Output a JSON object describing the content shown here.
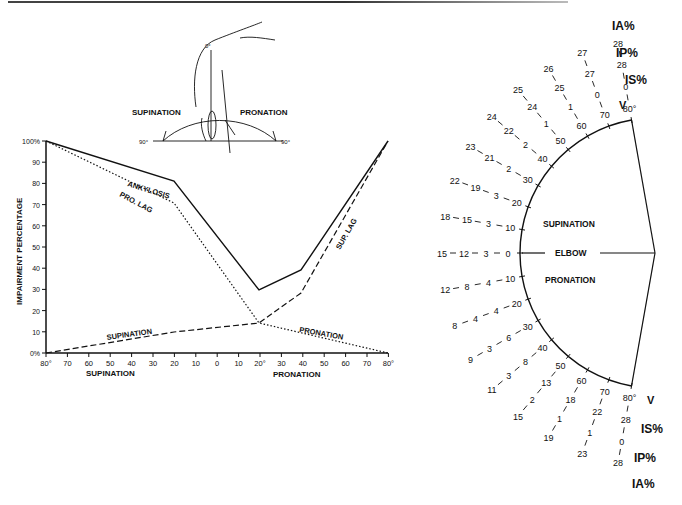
{
  "chart_data": [
    {
      "type": "line",
      "title": "",
      "xlabel_left": "SUPINATION",
      "xlabel_right": "PRONATION",
      "ylabel": "IMPAIRMENT PERCENTAGE",
      "ylim": [
        0,
        100
      ],
      "yticks": [
        "0%",
        "10",
        "20",
        "30",
        "40",
        "50",
        "60",
        "70",
        "80",
        "90",
        "100%"
      ],
      "xticks": [
        "80°",
        "70",
        "60",
        "50",
        "40",
        "30",
        "20",
        "10",
        "0",
        "10",
        "20°",
        "30",
        "40",
        "50",
        "60",
        "70",
        "80°"
      ],
      "x_note": "Left side = supination degrees 80→0, right side = pronation degrees 0→80",
      "series": [
        {
          "name": "ANKYLOSIS",
          "style": "solid",
          "points": [
            [
              "S80",
              100
            ],
            [
              "S20",
              80
            ],
            [
              "P20",
              30
            ],
            [
              "P40",
              40
            ],
            [
              "P80",
              100
            ]
          ]
        },
        {
          "name": "PRO. LAG",
          "style": "dotted",
          "points": [
            [
              "S80",
              100
            ],
            [
              "S20",
              70
            ],
            [
              "P20",
              15
            ],
            [
              "P80",
              0
            ]
          ]
        },
        {
          "name": "SUP. LAG",
          "style": "dashed",
          "points": [
            [
              "S80",
              0
            ],
            [
              "S20",
              10
            ],
            [
              "P20",
              15
            ],
            [
              "P40",
              30
            ],
            [
              "P80",
              100
            ]
          ]
        },
        {
          "name": "SUPINATION",
          "style": "dashed",
          "points": [
            [
              "S80",
              0
            ],
            [
              "S20",
              10
            ],
            [
              "P20",
              15
            ]
          ]
        },
        {
          "name": "PRONATION",
          "style": "dotted",
          "points": [
            [
              "P20",
              15
            ],
            [
              "P80",
              0
            ]
          ]
        }
      ],
      "annotations": [
        "ANKYLOSIS",
        "PRO. LAG",
        "SUP. LAG",
        "SUPINATION",
        "PRONATION"
      ]
    },
    {
      "type": "table",
      "title": "Elbow pie chart (supination / pronation)",
      "center_label": "ELBOW",
      "upper_label": "SUPINATION",
      "lower_label": "PRONATION",
      "column_headers": [
        "V",
        "IS%",
        "IP%",
        "IA%"
      ],
      "supination_rows": [
        {
          "angle": "0",
          "IS": "3",
          "IP": "12",
          "IA": "15"
        },
        {
          "angle": "10",
          "IS": "3",
          "IP": "15",
          "IA": "18"
        },
        {
          "angle": "20",
          "IS": "3",
          "IP": "19",
          "IA": "22"
        },
        {
          "angle": "30",
          "IS": "2",
          "IP": "21",
          "IA": "23"
        },
        {
          "angle": "40",
          "IS": "2",
          "IP": "22",
          "IA": "24"
        },
        {
          "angle": "50",
          "IS": "1",
          "IP": "24",
          "IA": "25"
        },
        {
          "angle": "60",
          "IS": "1",
          "IP": "25",
          "IA": "26"
        },
        {
          "angle": "70",
          "IS": "0",
          "IP": "27",
          "IA": "27"
        },
        {
          "angle": "80°",
          "IS": "0",
          "IP": "28",
          "IA": "28"
        }
      ],
      "pronation_rows": [
        {
          "angle": "10",
          "IS": "4",
          "IP": "8",
          "IA": "12"
        },
        {
          "angle": "20",
          "IS": "4",
          "IP": "4",
          "IA": "8"
        },
        {
          "angle": "30",
          "IS": "6",
          "IP": "3",
          "IA": "9"
        },
        {
          "angle": "40",
          "IS": "8",
          "IP": "3",
          "IA": "11"
        },
        {
          "angle": "50",
          "IS": "13",
          "IP": "2",
          "IA": "15"
        },
        {
          "angle": "60",
          "IS": "18",
          "IP": "1",
          "IA": "19"
        },
        {
          "angle": "70",
          "IS": "22",
          "IP": "1",
          "IA": "23"
        },
        {
          "angle": "80°",
          "IS": "28",
          "IP": "0",
          "IA": "28"
        }
      ]
    }
  ],
  "inset": {
    "zero_label": "0°",
    "left_label": "SUPINATION",
    "right_label": "PRONATION",
    "left_deg": "90°",
    "right_deg": "90°"
  },
  "labels": {
    "ylabel": "IMPAIRMENT PERCENTAGE",
    "x_sup": "SUPINATION",
    "x_pro": "PRONATION",
    "ankylosis": "ANKYLOSIS",
    "pro_lag": "PRO. LAG",
    "sup_lag": "SUP. LAG",
    "supination_curve": "SUPINATION",
    "pronation_curve": "PRONATION",
    "pie_sup": "SUPINATION",
    "pie_elbow": "ELBOW",
    "pie_pro": "PRONATION",
    "v": "V",
    "is_top": "IS%",
    "ip_top": "IP%",
    "ia_top": "IA%",
    "is_bot": "IS%",
    "ip_bot": "IP%",
    "ia_bot": "IA%"
  }
}
